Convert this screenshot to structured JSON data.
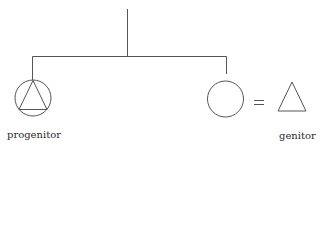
{
  "diagram": {
    "type": "kinship-diagram",
    "colors": {
      "stroke": "#555555",
      "text": "#2a2a2a",
      "background": "#ffffff"
    },
    "nodes": [
      {
        "id": "progenitor",
        "shape": "circle-with-triangle",
        "label": "progenitor"
      },
      {
        "id": "female",
        "shape": "circle",
        "label": ""
      },
      {
        "id": "genitor",
        "shape": "triangle",
        "label": "genitor"
      }
    ],
    "relations": [
      {
        "type": "descent-line",
        "from": "parent",
        "to": [
          "progenitor",
          "female"
        ]
      },
      {
        "type": "marriage",
        "symbol": "=",
        "between": [
          "female",
          "genitor"
        ]
      }
    ],
    "labels": {
      "progenitor": "progenitor",
      "genitor": "genitor",
      "marriage_symbol": "="
    }
  }
}
